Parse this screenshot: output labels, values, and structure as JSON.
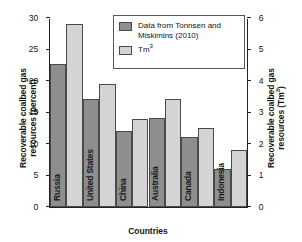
{
  "chart_data": {
    "type": "bar",
    "title": "",
    "xlabel": "Countries",
    "ylabel": "Recoverable coalbed gas resources (percent)",
    "ylabel_right": "Recoverable coalbed gas resources (Tm3)",
    "ylabel_left_line1": "Recoverable coalbed gas",
    "ylabel_left_line2": "resources (percent)",
    "ylabel_right_line1": "Recoverable coalbed gas",
    "ylabel_right_line2": "resources (Tm",
    "ylabel_right_sup": "3",
    "ylabel_right_tail": ")",
    "categories": [
      "Russia",
      "United States",
      "China",
      "Australia",
      "Canada",
      "Indonesia"
    ],
    "series": [
      {
        "name": "Data from Tonnsen and Miskimins (2010)",
        "unit": "percent",
        "axis": "left",
        "color": "#8e8e8e",
        "values": [
          22.7,
          17.2,
          12.1,
          14.2,
          11.1,
          6.1
        ]
      },
      {
        "name": "Tm3",
        "unit": "Tm3",
        "axis": "right",
        "color": "#d4d4d4",
        "values_percent_scale": [
          29.0,
          19.5,
          14.0,
          17.1,
          12.5,
          9.1
        ],
        "values": [
          5.8,
          3.9,
          2.8,
          3.4,
          2.5,
          1.8
        ]
      }
    ],
    "ylim": [
      0,
      30
    ],
    "yticks": [
      "0",
      "5",
      "10",
      "15",
      "20",
      "25",
      "30"
    ],
    "ylim_right": [
      0,
      6
    ],
    "yticks_right": [
      "0",
      "1",
      "2",
      "3",
      "4",
      "5",
      "6"
    ],
    "grid": false,
    "legend_position": "top-center"
  },
  "legend": {
    "entries": [
      {
        "label": "Data from Tonnsen and Miskimins (2010)",
        "line1": "Data from Tonnsen and",
        "line2": "Miskimins (2010)",
        "swatch": "pct"
      },
      {
        "label": "Tm3",
        "base": "Tm",
        "sup": "3",
        "swatch": "tm3"
      }
    ]
  }
}
